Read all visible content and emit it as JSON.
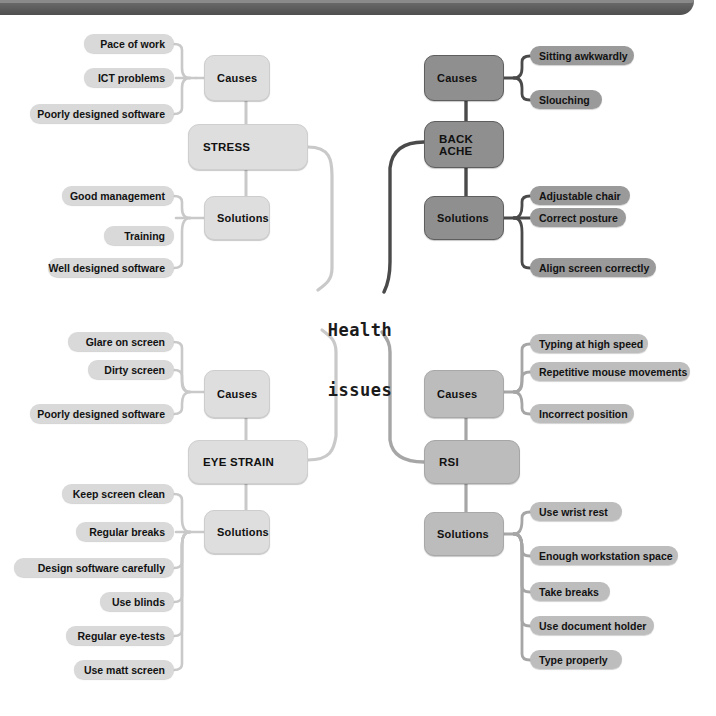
{
  "diagram": {
    "title": "Health issues",
    "center_label_line1": "Health",
    "center_label_line2": "issues",
    "colors": {
      "background": "#ffffff",
      "frame_bar": "#5d5d5d",
      "branch_stress": "#dedede",
      "branch_back_ache": "#8f8f8f",
      "branch_eye_strain": "#dedede",
      "branch_rsi": "#bcbcbc",
      "text": "#111111",
      "link_light": "#c9c9c9",
      "link_mid": "#a6a6a6",
      "link_dark": "#4a4a4a"
    },
    "branches": [
      {
        "id": "stress",
        "label": "STRESS",
        "tone": "light",
        "groups": [
          {
            "label": "Causes",
            "items": [
              "Pace of work",
              "ICT problems",
              "Poorly designed software"
            ]
          },
          {
            "label": "Solutions",
            "items": [
              "Good management",
              "Training",
              "Well designed software"
            ]
          }
        ]
      },
      {
        "id": "back-ache",
        "label": "BACK ACHE",
        "tone": "dark",
        "groups": [
          {
            "label": "Causes",
            "items": [
              "Sitting awkwardly",
              "Slouching"
            ]
          },
          {
            "label": "Solutions",
            "items": [
              "Adjustable chair",
              "Correct posture",
              "Align screen correctly"
            ]
          }
        ]
      },
      {
        "id": "eye-strain",
        "label": "EYE STRAIN",
        "tone": "light",
        "groups": [
          {
            "label": "Causes",
            "items": [
              "Glare on screen",
              "Dirty screen",
              "Poorly designed software"
            ]
          },
          {
            "label": "Solutions",
            "items": [
              "Keep screen clean",
              "Regular breaks",
              "Design software carefully",
              "Use blinds",
              "Regular eye-tests",
              "Use matt screen"
            ]
          }
        ]
      },
      {
        "id": "rsi",
        "label": "RSI",
        "tone": "mid",
        "groups": [
          {
            "label": "Causes",
            "items": [
              "Typing at high speed",
              "Repetitive mouse movements",
              "Incorrect position"
            ]
          },
          {
            "label": "Solutions",
            "items": [
              "Use wrist rest",
              "Enough workstation space",
              "Take breaks",
              "Use document holder",
              "Type properly"
            ]
          }
        ]
      }
    ]
  }
}
